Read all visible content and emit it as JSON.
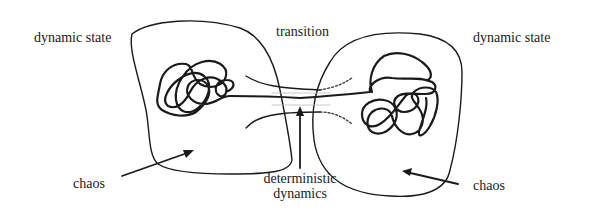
{
  "labels": {
    "left_state": "dynamic state",
    "right_state": "dynamic state",
    "transition": "transition",
    "left_chaos": "chaos",
    "right_chaos": "chaos",
    "deterministic_line1": "deterministic",
    "deterministic_line2": "dynamics"
  },
  "colors": {
    "stroke": "#1a1a1a",
    "dotted": "#333333",
    "background": "#ffffff"
  }
}
